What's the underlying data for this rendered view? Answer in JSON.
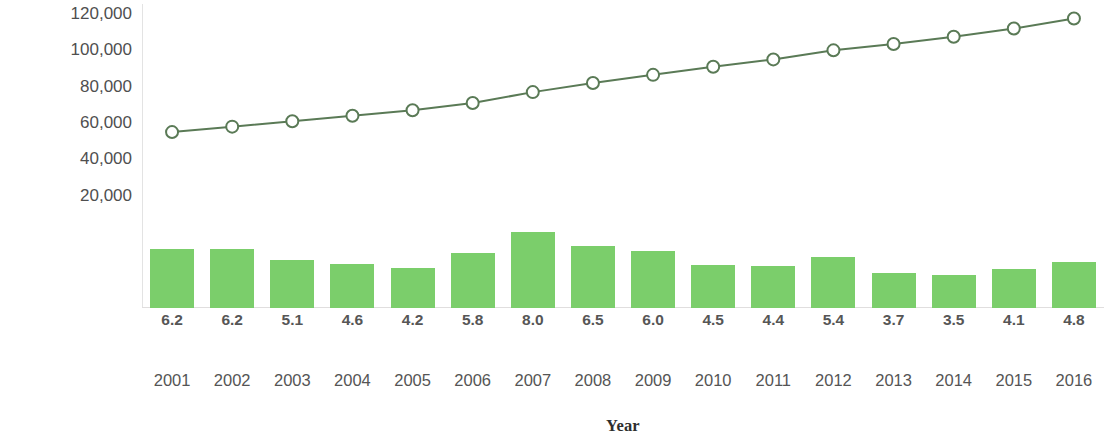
{
  "chart_data": {
    "type": "bar",
    "title": "",
    "subtitle": "",
    "xlabel": "Year",
    "ylabel": "Plant varieties in force",
    "categories": [
      "2001",
      "2002",
      "2003",
      "2004",
      "2005",
      "2006",
      "2007",
      "2008",
      "2009",
      "2010",
      "2011",
      "2012",
      "2013",
      "2014",
      "2015",
      "2016"
    ],
    "ylim": [
      0,
      120000
    ],
    "yticks": [
      20000,
      40000,
      60000,
      80000,
      100000,
      120000
    ],
    "ytick_labels": [
      "20,000",
      "40,000",
      "60,000",
      "80,000",
      "100,000",
      "120,000"
    ],
    "grid": false,
    "legend": "none",
    "series": [
      {
        "name": "Plant varieties in force",
        "type": "line",
        "marker": "open-circle",
        "color": "#5a7a56",
        "axis": "primary",
        "values": [
          55000,
          58000,
          61000,
          64000,
          67000,
          71000,
          77000,
          82000,
          86500,
          91000,
          95000,
          100000,
          103500,
          107500,
          112000,
          117500
        ]
      },
      {
        "name": "Plant variety applications (thousands)",
        "type": "bar",
        "color": "#7bce6b",
        "axis": "secondary",
        "data_labels": [
          "6.2",
          "6.2",
          "5.1",
          "4.6",
          "4.2",
          "5.8",
          "8.0",
          "6.5",
          "6.0",
          "4.5",
          "4.4",
          "5.4",
          "3.7",
          "3.5",
          "4.1",
          "4.8"
        ],
        "values": [
          6.2,
          6.2,
          5.1,
          4.6,
          4.2,
          5.8,
          8.0,
          6.5,
          6.0,
          4.5,
          4.4,
          5.4,
          3.7,
          3.5,
          4.1,
          4.8
        ]
      }
    ]
  },
  "axis": {
    "y_title": "Plant varieties in force",
    "x_title": "Year"
  },
  "colors": {
    "bar_green": "#7bce6b",
    "line_green": "#5a7a56",
    "marker_fill": "#ffffff",
    "axis_gray": "#e0dede",
    "text_gray": "#4f4f4f",
    "title_dark": "#2e2e2e"
  }
}
